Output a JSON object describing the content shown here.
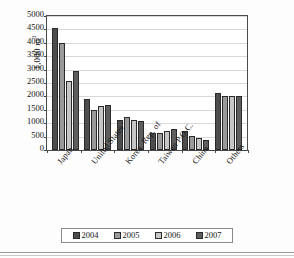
{
  "chart_data": {
    "type": "bar",
    "title": "",
    "xlabel": "",
    "ylabel": "1,000 m",
    "ylabel_sup": "3",
    "ylim": [
      0,
      5000
    ],
    "ytick_step": 500,
    "yticks": [
      5000,
      4500,
      4000,
      3500,
      3000,
      2500,
      2000,
      1500,
      1000,
      500,
      0
    ],
    "grid": true,
    "legend_position": "bottom",
    "categories": [
      "Japan",
      "United States",
      "Korea, Rep. of",
      "Taiwan P.O.C.",
      "China",
      "Others"
    ],
    "series": [
      {
        "name": "2004",
        "color": "#4d4d4d",
        "values": [
          4550,
          1900,
          1120,
          650,
          720,
          2130
        ]
      },
      {
        "name": "2005",
        "color": "#9a9a9a",
        "values": [
          4000,
          1500,
          1230,
          650,
          520,
          2000
        ]
      },
      {
        "name": "2006",
        "color": "#c6c6c6",
        "values": [
          2570,
          1660,
          1130,
          700,
          440,
          2010
        ]
      },
      {
        "name": "2007",
        "color": "#5e5e5e",
        "values": [
          2930,
          1670,
          1070,
          780,
          360,
          2030
        ]
      }
    ]
  },
  "legend": {
    "items": [
      {
        "label": "2004"
      },
      {
        "label": "2005"
      },
      {
        "label": "2006"
      },
      {
        "label": "2007"
      }
    ]
  }
}
